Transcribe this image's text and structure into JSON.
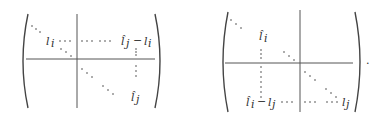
{
  "figure": {
    "type": "block-matrix-illustration",
    "matrices": [
      {
        "id": "left",
        "labels": {
          "row_entry": "l_i",
          "top_right_entry": "l̂_j − l_i",
          "bottom_right_entry": "l̂_j"
        },
        "text": {
          "l_i": "l",
          "l_i_sub": "i",
          "lhat_j": "l̂",
          "lhat_j_sub": "j",
          "minus": "−",
          "l_i2": "l",
          "l_i2_sub": "i",
          "lhat_j2": "l̂",
          "lhat_j2_sub": "j"
        }
      },
      {
        "id": "right",
        "labels": {
          "top_entry": "l̂_i",
          "bottom_left_entry": "l̂_i − l_j",
          "bottom_right_entry": "l_j"
        },
        "text": {
          "lhat_i": "l̂",
          "lhat_i_sub": "i",
          "lhat_i2": "l̂",
          "lhat_i2_sub": "i",
          "minus": "−",
          "l_j": "l",
          "l_j_sub": "j",
          "l_j2": "l",
          "l_j2_sub": "j"
        }
      }
    ],
    "trailing_punctuation": "."
  }
}
